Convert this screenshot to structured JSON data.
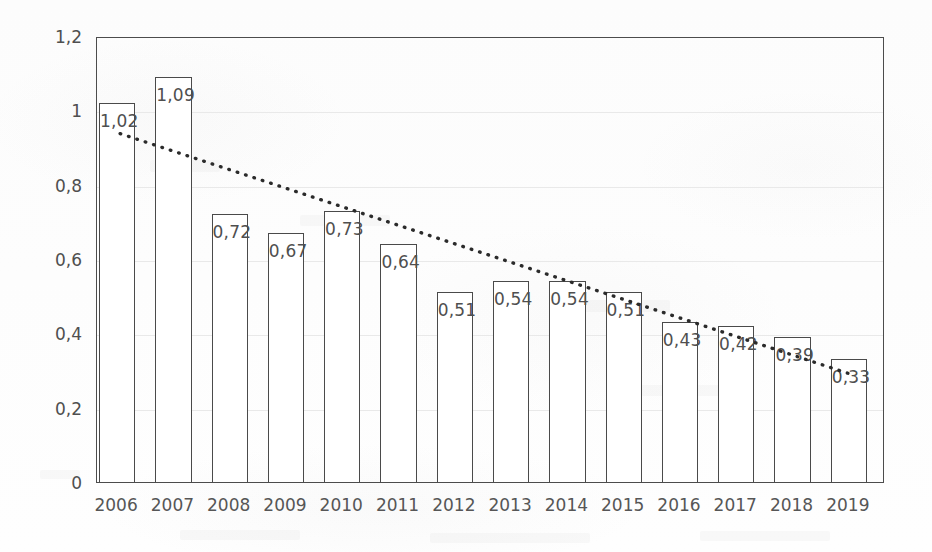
{
  "chart_data": {
    "type": "bar",
    "title": "",
    "subtitle": "",
    "xlabel": "",
    "ylabel": "",
    "categories": [
      "2006",
      "2007",
      "2008",
      "2009",
      "2010",
      "2011",
      "2012",
      "2013",
      "2014",
      "2015",
      "2016",
      "2017",
      "2018",
      "2019"
    ],
    "values": [
      1.02,
      1.09,
      0.72,
      0.67,
      0.73,
      0.64,
      0.51,
      0.54,
      0.54,
      0.51,
      0.43,
      0.42,
      0.39,
      0.33
    ],
    "data_labels": [
      "1,02",
      "1,09",
      "0,72",
      "0,67",
      "0,73",
      "0,64",
      "0,51",
      "0,54",
      "0,54",
      "0,51",
      "0,43",
      "0,42",
      "0,39",
      "0,33"
    ],
    "ylim": [
      0,
      1.2
    ],
    "ytick_values": [
      1.2,
      1.0,
      0.8,
      0.6,
      0.4,
      0.2,
      0
    ],
    "ytick_labels": [
      "1,2",
      "1",
      "0,8",
      "0,6",
      "0,4",
      "0,2",
      "0"
    ],
    "grid": true,
    "legend": "none",
    "decimal_separator": ",",
    "series": [
      {
        "name": "values",
        "type": "bar",
        "values": [
          1.02,
          1.09,
          0.72,
          0.67,
          0.73,
          0.64,
          0.51,
          0.54,
          0.54,
          0.51,
          0.43,
          0.42,
          0.39,
          0.33
        ],
        "fill_color": "#ffffff",
        "outline_color": "#4a4a4a"
      },
      {
        "name": "trendline",
        "type": "line",
        "style": "dotted",
        "color": "#2b2b2b",
        "start_value": 0.94,
        "end_value": 0.29,
        "start_category": "2006",
        "end_category": "2019"
      }
    ]
  },
  "axes": {
    "y_tick_labels": [
      "1,2",
      "1",
      "0,8",
      "0,6",
      "0,4",
      "0,2",
      "0"
    ],
    "x_tick_labels": [
      "2006",
      "2007",
      "2008",
      "2009",
      "2010",
      "2011",
      "2012",
      "2013",
      "2014",
      "2015",
      "2016",
      "2017",
      "2018",
      "2019"
    ]
  },
  "colors": {
    "background": "#fefefe",
    "frame": "#4c4c4c",
    "bar_outline": "#4a4a4a",
    "bar_fill": "#ffffff",
    "text": "#4f4f4f",
    "xtick_text": "#565656",
    "gridline": "#e9e9e9",
    "trendline": "#2b2b2b"
  }
}
